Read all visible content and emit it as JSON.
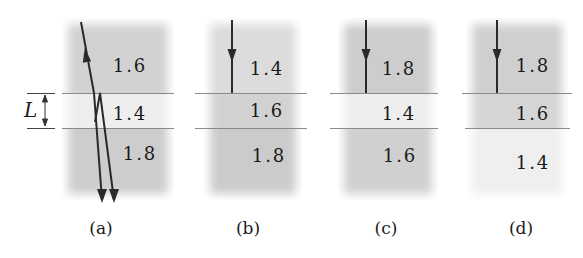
{
  "colors": {
    "dark_band": "#c9c9c9",
    "mid_band": "#d6d6d6",
    "light_band": "#eeeeee",
    "ray": "#2a2a2a",
    "interface": "#8a8a8a"
  },
  "thickness_label": "L",
  "panels": [
    {
      "caption": "(a)",
      "layers": [
        {
          "index": "1.6"
        },
        {
          "index": "1.4"
        },
        {
          "index": "1.8"
        }
      ],
      "rays": "incident ray refracts into film, reflects at lower interface, both transmitted rays exit downward"
    },
    {
      "caption": "(b)",
      "layers": [
        {
          "index": "1.4"
        },
        {
          "index": "1.6"
        },
        {
          "index": "1.8"
        }
      ],
      "rays": "normal incidence arrow"
    },
    {
      "caption": "(c)",
      "layers": [
        {
          "index": "1.8"
        },
        {
          "index": "1.4"
        },
        {
          "index": "1.6"
        }
      ],
      "rays": "normal incidence arrow"
    },
    {
      "caption": "(d)",
      "layers": [
        {
          "index": "1.8"
        },
        {
          "index": "1.6"
        },
        {
          "index": "1.4"
        }
      ],
      "rays": "normal incidence arrow"
    }
  ]
}
